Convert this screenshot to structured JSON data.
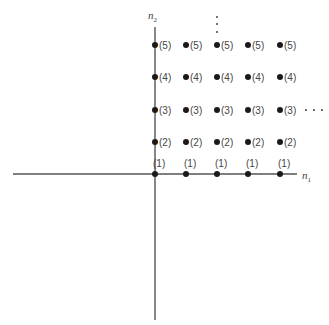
{
  "diagram": {
    "axes": {
      "x_label": "n",
      "x_label_sub": "1",
      "y_label": "n",
      "y_label_sub": "2"
    },
    "columns": 5,
    "rows": [
      {
        "label": "(5)"
      },
      {
        "label": "(4)"
      },
      {
        "label": "(3)"
      },
      {
        "label": "(2)"
      },
      {
        "label": "(1)"
      }
    ],
    "ellipsis_vertical": "⋮",
    "ellipsis_horizontal": "⋯"
  }
}
